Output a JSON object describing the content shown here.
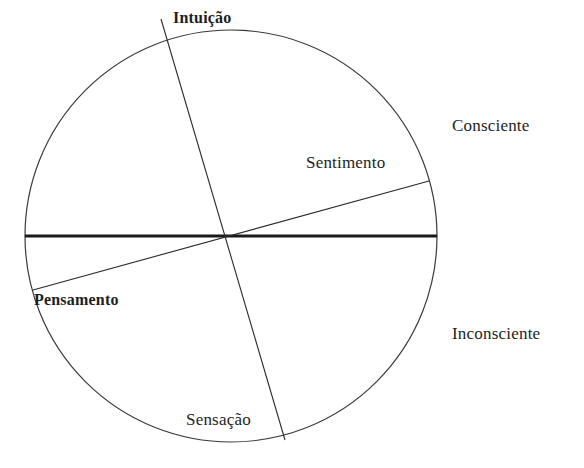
{
  "diagram": {
    "type": "jungian-psychological-functions-circle",
    "functions": {
      "top": "Intuição",
      "right": "Sentimento",
      "left": "Pensamento",
      "bottom": "Sensação"
    },
    "regions": {
      "upper": "Consciente",
      "lower": "Inconsciente"
    },
    "colors": {
      "stroke": "#2a2a2a",
      "text": "#1e1e1e",
      "background": "#ffffff"
    }
  }
}
